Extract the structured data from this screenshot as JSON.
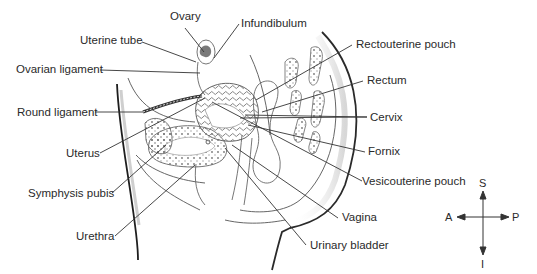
{
  "diagram": {
    "labels": {
      "ovary": "Ovary",
      "infundibulum": "Infundibulum",
      "uterine_tube": "Uterine tube",
      "ovarian_ligament": "Ovarian ligament",
      "round_ligament": "Round ligament",
      "uterus": "Uterus",
      "symphysis_pubis": "Symphysis pubis",
      "urethra": "Urethra",
      "rectouterine_pouch": "Rectouterine pouch",
      "rectum": "Rectum",
      "cervix": "Cervix",
      "fornix": "Fornix",
      "vesicouterine_pouch": "Vesicouterine pouch",
      "vagina": "Vagina",
      "urinary_bladder": "Urinary bladder"
    },
    "compass": {
      "superior": "S",
      "inferior": "I",
      "anterior": "A",
      "posterior": "P"
    },
    "colors": {
      "line": "#333333",
      "outline": "#555555",
      "ovary_fill": "#7a7a7a",
      "text": "#2a2a2a"
    }
  }
}
